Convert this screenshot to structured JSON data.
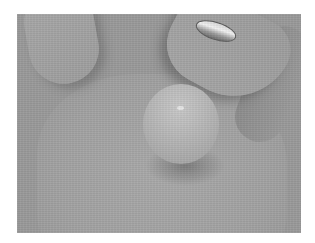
{
  "image": {
    "description": "Grayscale photograph of an open hand holding a small round pearl-like ball in the palm; a ring is visible on a finger at the top",
    "subjects": [
      "hand",
      "palm",
      "round object",
      "ring"
    ],
    "colors": {
      "background": "#ffffff",
      "photo_base": "#9a9a9a",
      "object": "#b8b8b8",
      "ring_highlight": "#f2f2f2"
    }
  }
}
